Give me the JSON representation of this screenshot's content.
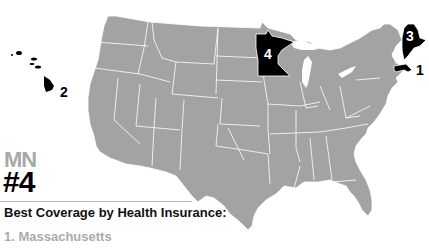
{
  "map": {
    "title": "Best Coverage by Health Insurance",
    "base_color": "#a3a3a3",
    "highlight_color": "#000000",
    "border_color": "#ffffff",
    "highlighted_states": [
      {
        "state": "Massachusetts",
        "abbr": "MA",
        "rank": "1"
      },
      {
        "state": "Hawaii",
        "abbr": "HI",
        "rank": "2"
      },
      {
        "state": "Maine",
        "abbr": "ME",
        "rank": "3"
      },
      {
        "state": "Minnesota",
        "abbr": "MN",
        "rank": "4"
      }
    ]
  },
  "callout": {
    "state_abbr": "MN",
    "rank": "#4",
    "heading": "Best Coverage by Health Insurance:",
    "list": [
      {
        "label": "1. Massachusetts"
      }
    ]
  },
  "labels": {
    "ma": "1",
    "hi": "2",
    "me": "3",
    "mn": "4"
  }
}
